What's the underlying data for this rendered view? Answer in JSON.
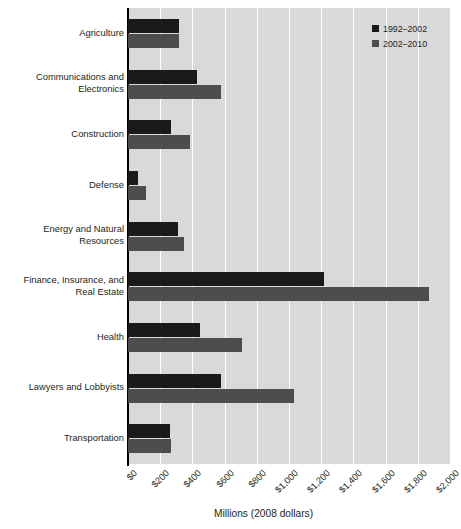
{
  "chart_data": {
    "type": "bar",
    "orientation": "horizontal",
    "title": "",
    "xlabel": "Millions (2008 dollars)",
    "ylabel": "",
    "xlim": [
      0,
      2000
    ],
    "xticks": [
      0,
      200,
      400,
      600,
      800,
      1000,
      1200,
      1400,
      1600,
      1800,
      2000
    ],
    "xtick_labels": [
      "$0",
      "$200",
      "$400",
      "$600",
      "$800",
      "$1,000",
      "$1,200",
      "$1,400",
      "$1,600",
      "$1,800",
      "$2,000"
    ],
    "grid": true,
    "grid_axis": "x",
    "legend_position": "upper right",
    "categories": [
      "Agriculture",
      "Communications and Electronics",
      "Construction",
      "Defense",
      "Energy and Natural Resources",
      "Finance, Insurance, and Real Estate",
      "Health",
      "Lawyers and Lobbyists",
      "Transportation"
    ],
    "category_lines": [
      [
        "Agriculture"
      ],
      [
        "Communications and",
        "Electronics"
      ],
      [
        "Construction"
      ],
      [
        "Defense"
      ],
      [
        "Energy and Natural",
        "Resources"
      ],
      [
        "Finance, Insurance, and",
        "Real Estate"
      ],
      [
        "Health"
      ],
      [
        "Lawyers and Lobbyists"
      ],
      [
        "Transportation"
      ]
    ],
    "series": [
      {
        "name": "1992–2002",
        "color": "#1a1a1a",
        "values": [
          315,
          430,
          265,
          60,
          310,
          1220,
          445,
          580,
          260
        ]
      },
      {
        "name": "2002–2010",
        "color": "#4d4d4d",
        "values": [
          315,
          575,
          385,
          110,
          350,
          1870,
          710,
          1030,
          270
        ]
      }
    ],
    "colors": {
      "plot_background": "#d9d9d9",
      "gridline": "#ffffff",
      "axis": "#000000",
      "text": "#231f20",
      "page_background": "#ffffff"
    }
  }
}
